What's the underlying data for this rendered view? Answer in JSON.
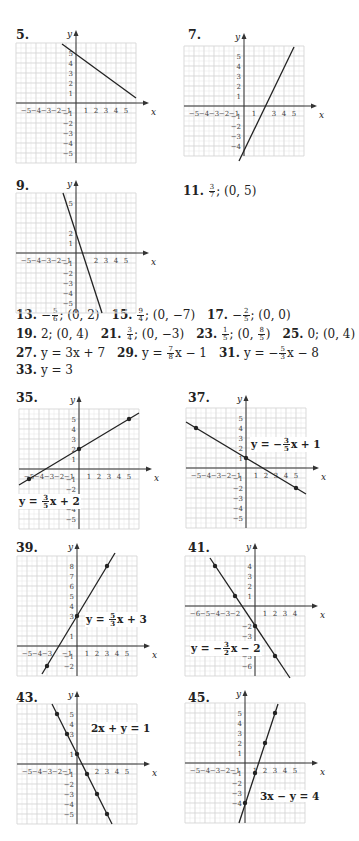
{
  "graphs": [
    {
      "id": "5",
      "label": "5.",
      "left": 14,
      "top": 27,
      "origin_x": 76,
      "origin_y": 103,
      "step": 10,
      "xmin": -6,
      "xmax": 6,
      "ymin": -6,
      "ymax": 6,
      "cols_left": 6,
      "cols_right": 6,
      "rows_up": 6,
      "rows_down": 6,
      "xticks": [
        "-5",
        "-4",
        "-3",
        "-2",
        "-1",
        "1",
        "2",
        "3",
        "4",
        "5"
      ],
      "xtick_vals": [
        -5,
        -4,
        -3,
        -2,
        -1,
        1,
        2,
        3,
        4,
        5
      ],
      "yticks": [
        "5",
        "4",
        "3",
        "2",
        "1",
        "-1",
        "-2",
        "-3",
        "-4",
        "-5"
      ],
      "ytick_vals": [
        5,
        4,
        3,
        2,
        1,
        -1,
        -2,
        -3,
        -4,
        -5
      ],
      "line": [
        [
          -1.4,
          5.9
        ],
        [
          6,
          0.5
        ]
      ],
      "points": [],
      "equation": "",
      "eq_x": 0,
      "eq_y": 0
    },
    {
      "id": "7",
      "label": "7.",
      "left": 186,
      "top": 27,
      "origin_x": 244,
      "origin_y": 106,
      "step": 10,
      "cols_left": 6,
      "cols_right": 6,
      "rows_up": 6,
      "rows_down": 5,
      "xticks": [
        "-5",
        "-4",
        "-3",
        "-2",
        "-1",
        "1",
        "3",
        "4",
        "5"
      ],
      "xtick_vals": [
        -5,
        -4,
        -3,
        -2,
        -1,
        1,
        3,
        4,
        5
      ],
      "yticks": [
        "5",
        "4",
        "3",
        "2",
        "1",
        "-1",
        "-2",
        "-3",
        "-4"
      ],
      "ytick_vals": [
        5,
        4,
        3,
        2,
        1,
        -1,
        -2,
        -3,
        -4
      ],
      "line": [
        [
          -0.5,
          -5.5
        ],
        [
          5,
          5.9
        ]
      ],
      "points": [],
      "equation": "",
      "eq_x": 0,
      "eq_y": 0
    },
    {
      "id": "9",
      "label": "9.",
      "left": 14,
      "top": 178,
      "origin_x": 76,
      "origin_y": 253,
      "step": 10,
      "cols_left": 6,
      "cols_right": 6,
      "rows_up": 6,
      "rows_down": 6,
      "xticks": [
        "-5",
        "-4",
        "-3",
        "-2",
        "-1",
        "2",
        "3",
        "4",
        "5"
      ],
      "xtick_vals": [
        -5,
        -4,
        -3,
        -2,
        -1,
        2,
        3,
        4,
        5
      ],
      "yticks": [
        "5",
        "2",
        "1",
        "-1",
        "-2",
        "-3",
        "-4",
        "-5"
      ],
      "ytick_vals": [
        5,
        2,
        1,
        -1,
        -2,
        -3,
        -4,
        -5
      ],
      "line": [
        [
          -1.3,
          6
        ],
        [
          2.6,
          -6
        ]
      ],
      "points": [],
      "equation": "",
      "eq_x": 0,
      "eq_y": 0
    },
    {
      "id": "35",
      "label": "35.",
      "left": 14,
      "top": 390,
      "origin_x": 79,
      "origin_y": 469,
      "step": 10,
      "cols_left": 6,
      "cols_right": 6,
      "rows_up": 6,
      "rows_down": 6,
      "xticks": [
        "-5",
        "-4",
        "-3",
        "-2",
        "-1",
        "1",
        "2",
        "3",
        "4",
        "5"
      ],
      "xtick_vals": [
        -5,
        -4,
        -3,
        -2,
        -1,
        1,
        2,
        3,
        4,
        5
      ],
      "yticks": [
        "5",
        "4",
        "3",
        "2",
        "1",
        "-1",
        "-2",
        "-3",
        "-4",
        "-5"
      ],
      "ytick_vals": [
        5,
        4,
        3,
        2,
        1,
        -1,
        -2,
        -3,
        -4,
        -5
      ],
      "line": [
        [
          -6,
          -1.6
        ],
        [
          6,
          5.6
        ]
      ],
      "points": [
        [
          -5,
          -1
        ],
        [
          0,
          2
        ],
        [
          5,
          5
        ]
      ],
      "equation_lhs": "y = ",
      "equation_frac": [
        "3",
        "5"
      ],
      "equation_rhs": "x + 2",
      "eq_left": 18,
      "eq_top": 494
    },
    {
      "id": "37",
      "label": "37.",
      "left": 186,
      "top": 390,
      "origin_x": 246,
      "origin_y": 468,
      "step": 10,
      "cols_left": 6,
      "cols_right": 6,
      "rows_up": 6,
      "rows_down": 6,
      "xticks": [
        "-5",
        "-4",
        "-3",
        "-2",
        "-1",
        "1",
        "2",
        "3",
        "4",
        "5"
      ],
      "xtick_vals": [
        -5,
        -4,
        -3,
        -2,
        -1,
        1,
        2,
        3,
        4,
        5
      ],
      "yticks": [
        "5",
        "4",
        "3",
        "2",
        "1",
        "-1",
        "-2",
        "-3",
        "-4",
        "-5"
      ],
      "ytick_vals": [
        5,
        4,
        3,
        2,
        1,
        -1,
        -2,
        -3,
        -4,
        -5
      ],
      "line": [
        [
          -6,
          4.6
        ],
        [
          6,
          -2.6
        ]
      ],
      "points": [
        [
          -5,
          4
        ],
        [
          0,
          1
        ],
        [
          5,
          -2
        ]
      ],
      "equation_lhs": "y = −",
      "equation_frac": [
        "3",
        "5"
      ],
      "equation_rhs": "x + 1",
      "eq_left": 250,
      "eq_top": 437
    },
    {
      "id": "39",
      "label": "39.",
      "left": 14,
      "top": 540,
      "origin_x": 77,
      "origin_y": 646,
      "step": 10,
      "cols_left": 6,
      "cols_right": 6,
      "rows_up": 9,
      "rows_down": 3,
      "xticks": [
        "-5",
        "-4",
        "-3",
        "-1",
        "1",
        "2",
        "3",
        "4",
        "5"
      ],
      "xtick_vals": [
        -5,
        -4,
        -3,
        -1,
        1,
        2,
        3,
        4,
        5
      ],
      "yticks": [
        "8",
        "7",
        "6",
        "5",
        "4",
        "3",
        "1",
        "-1",
        "-2"
      ],
      "ytick_vals": [
        8,
        7,
        6,
        5,
        4,
        3,
        1,
        -1,
        -2
      ],
      "line": [
        [
          -3.5,
          -2.8
        ],
        [
          3.8,
          9.3
        ]
      ],
      "points": [
        [
          -3,
          -2
        ],
        [
          0,
          3
        ],
        [
          3,
          8
        ]
      ],
      "equation_lhs": "y = ",
      "equation_frac": [
        "5",
        "3"
      ],
      "equation_rhs": "x + 3",
      "eq_left": 85,
      "eq_top": 612
    },
    {
      "id": "41",
      "label": "41.",
      "left": 186,
      "top": 540,
      "origin_x": 255,
      "origin_y": 606,
      "step": 10,
      "cols_left": 7,
      "cols_right": 5,
      "rows_up": 5,
      "rows_down": 7,
      "xticks": [
        "-6",
        "-5",
        "-4",
        "-3",
        "-2",
        "1",
        "2",
        "3",
        "4"
      ],
      "xtick_vals": [
        -6,
        -5,
        -4,
        -3,
        -2,
        1,
        2,
        3,
        4
      ],
      "yticks": [
        "4",
        "3",
        "2",
        "1",
        "-2",
        "-3",
        "-4",
        "-5",
        "-6"
      ],
      "ytick_vals": [
        4,
        3,
        2,
        1,
        -2,
        -3,
        -4,
        -5,
        -6
      ],
      "line": [
        [
          -4.5,
          4.8
        ],
        [
          3.5,
          -7.2
        ]
      ],
      "points": [
        [
          -4,
          4
        ],
        [
          -2,
          1
        ],
        [
          0,
          -2
        ],
        [
          2,
          -5
        ]
      ],
      "equation_lhs": "y = −",
      "equation_frac": [
        "3",
        "2"
      ],
      "equation_rhs": "x − 2",
      "eq_left": 190,
      "eq_top": 641
    },
    {
      "id": "43",
      "label": "43.",
      "left": 14,
      "top": 690,
      "origin_x": 77,
      "origin_y": 764,
      "step": 10,
      "cols_left": 6,
      "cols_right": 6,
      "rows_up": 6,
      "rows_down": 6,
      "xticks": [
        "-5",
        "-4",
        "-3",
        "-2",
        "-1",
        "2",
        "3",
        "4",
        "5"
      ],
      "xtick_vals": [
        -5,
        -4,
        -3,
        -2,
        -1,
        2,
        3,
        4,
        5
      ],
      "yticks": [
        "5",
        "4",
        "3",
        "1",
        "-1",
        "-2",
        "-3",
        "-4",
        "-5"
      ],
      "ytick_vals": [
        5,
        4,
        3,
        1,
        -1,
        -2,
        -3,
        -4,
        -5
      ],
      "line": [
        [
          -2.5,
          6
        ],
        [
          3.5,
          -6
        ]
      ],
      "points": [
        [
          -2,
          5
        ],
        [
          -1,
          3
        ],
        [
          0,
          1
        ],
        [
          1,
          -1
        ],
        [
          2,
          -3
        ],
        [
          3,
          -5
        ]
      ],
      "equation_plain": "2x + y = 1",
      "eq_left": 90,
      "eq_top": 722
    },
    {
      "id": "45",
      "label": "45.",
      "left": 186,
      "top": 690,
      "origin_x": 245,
      "origin_y": 763,
      "step": 10,
      "cols_left": 6,
      "cols_right": 6,
      "rows_up": 6,
      "rows_down": 6,
      "xticks": [
        "-5",
        "-4",
        "-3",
        "-2",
        "-1",
        "1",
        "2",
        "3",
        "4",
        "5"
      ],
      "xtick_vals": [
        -5,
        -4,
        -3,
        -2,
        -1,
        1,
        2,
        3,
        4,
        5
      ],
      "yticks": [
        "5",
        "4",
        "3",
        "2",
        "1",
        "-1",
        "-2",
        "-3",
        "-4"
      ],
      "ytick_vals": [
        5,
        4,
        3,
        2,
        1,
        -1,
        -2,
        -3,
        -4
      ],
      "line": [
        [
          -0.6,
          -6
        ],
        [
          3.3,
          5.9
        ]
      ],
      "points": [
        [
          0,
          -4
        ],
        [
          1,
          -1
        ],
        [
          2,
          2
        ],
        [
          3,
          5
        ]
      ],
      "equation_plain": "3x − y = 4",
      "eq_left": 259,
      "eq_top": 790
    }
  ],
  "answer11": {
    "label": "11.",
    "frac": [
      "3",
      "7"
    ],
    "rest": "; (0, 5)"
  },
  "answers": [
    {
      "line": 1,
      "items": [
        {
          "num": "13.",
          "pre": "−",
          "frac": [
            "5",
            "6"
          ],
          "post": "; (0, 2)"
        },
        {
          "num": "15.",
          "pre": "",
          "frac": [
            "9",
            "4"
          ],
          "post": "; (0, −7)"
        },
        {
          "num": "17.",
          "pre": "−",
          "frac": [
            "2",
            "5"
          ],
          "post": "; (0, 0)"
        }
      ]
    },
    {
      "line": 2,
      "items": [
        {
          "num": "19.",
          "pre": "2; (0, 4)",
          "frac": null,
          "post": ""
        },
        {
          "num": "21.",
          "pre": "",
          "frac": [
            "3",
            "4"
          ],
          "post": "; (0, −3)"
        },
        {
          "num": "23.",
          "pre": "",
          "frac": [
            "1",
            "5"
          ],
          "post": "; (0, ",
          "frac2": [
            "8",
            "5"
          ],
          "post2": ")"
        },
        {
          "num": "25.",
          "pre": "0; (0, 4)",
          "frac": null,
          "post": ""
        }
      ]
    },
    {
      "line": 3,
      "items": [
        {
          "num": "27.",
          "pre": "y = 3x + 7",
          "frac": null,
          "post": ""
        },
        {
          "num": "29.",
          "pre": "y = ",
          "frac": [
            "7",
            "8"
          ],
          "post": "x − 1"
        },
        {
          "num": "31.",
          "pre": "y = −",
          "frac": [
            "5",
            "3"
          ],
          "post": "x − 8"
        }
      ]
    },
    {
      "line": 4,
      "items": [
        {
          "num": "33.",
          "pre": "y = 3",
          "frac": null,
          "post": ""
        }
      ]
    }
  ],
  "axis_labels": {
    "x": "x",
    "y": "y"
  },
  "colors": {
    "grid": "#d6d6d6",
    "axis": "#333333",
    "line": "#222222",
    "text": "#222222"
  }
}
